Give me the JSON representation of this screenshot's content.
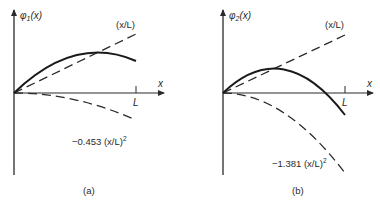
{
  "figure": {
    "panels": [
      {
        "id": "a",
        "caption": "(a)",
        "y_label_main": "φ",
        "y_label_sub": "1",
        "y_label_arg": "(x)",
        "x_label": "x",
        "tick_label": "L",
        "line_label": "(x/L)",
        "parabola_label_coef": "−0.453 (x/L)",
        "parabola_label_exp": "2",
        "coefficient": -0.453
      },
      {
        "id": "b",
        "caption": "(b)",
        "y_label_main": "φ",
        "y_label_sub": "2",
        "y_label_arg": "(x)",
        "x_label": "x",
        "tick_label": "L",
        "line_label": "(x/L)",
        "parabola_label_coef": "−1.381 (x/L)",
        "parabola_label_exp": "2",
        "coefficient": -1.381
      }
    ]
  },
  "colors": {
    "ink": "#2a2a2a",
    "background": "#ffffff"
  }
}
